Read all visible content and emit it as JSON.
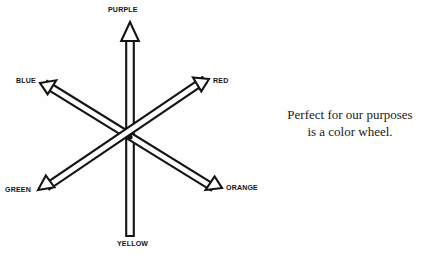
{
  "figure": {
    "type": "color-wheel-diagram",
    "background_color": "#fefefe",
    "ink_color": "#141414",
    "center": {
      "x": 130,
      "y": 137
    }
  },
  "axes": [
    {
      "id": "purple",
      "label": "PURPLE",
      "direction": "up",
      "arrowhead": true,
      "tip": {
        "x": 130,
        "y": 22
      }
    },
    {
      "id": "blue",
      "label": "BLUE",
      "direction": "upper-left",
      "arrowhead": true,
      "tip": {
        "x": 40,
        "y": 83
      }
    },
    {
      "id": "red",
      "label": "RED",
      "direction": "upper-right",
      "arrowhead": true,
      "tip": {
        "x": 209,
        "y": 79
      }
    },
    {
      "id": "green",
      "label": "GREEN",
      "direction": "lower-left",
      "arrowhead": true,
      "tip": {
        "x": 38,
        "y": 190
      }
    },
    {
      "id": "orange",
      "label": "ORANGE",
      "direction": "lower-right",
      "arrowhead": true,
      "tip": {
        "x": 222,
        "y": 188
      }
    },
    {
      "id": "yellow",
      "label": "YELLOW",
      "direction": "down",
      "arrowhead": false,
      "tip": {
        "x": 130,
        "y": 236
      }
    }
  ],
  "caption": {
    "line1": "Perfect for our purposes",
    "line2": "is a color wheel."
  }
}
